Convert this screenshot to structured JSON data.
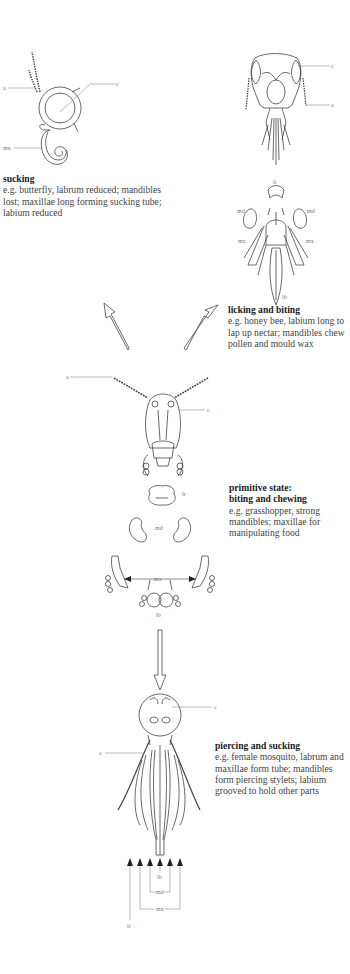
{
  "diagram": {
    "panels": [
      {
        "id": "butterfly",
        "title": "sucking",
        "body": "e.g. butterfly, labrum reduced; mandibles lost; maxillae long forming sucking tube; labium reduced",
        "labels": {
          "a": "a",
          "c": "c",
          "mx": "mx"
        }
      },
      {
        "id": "bee",
        "title": "licking and biting",
        "body": "e.g. honey bee, labium long to lap up nectar; mandibles chew pollen and mould wax",
        "labels": {
          "c": "c",
          "a": "a",
          "lr": "lr",
          "md_left": "md",
          "md_right": "md",
          "mx_left": "mx",
          "mx_right": "mx",
          "lb": "lb"
        }
      },
      {
        "id": "grasshopper",
        "title_line1": "primitive state:",
        "title_line2": "biting and chewing",
        "body": "e.g. grasshopper, strong mandibles; maxillae for manipulating food",
        "labels": {
          "a": "a",
          "c": "c",
          "lr": "lr",
          "md": "md",
          "mx": "mx",
          "lb": "lb"
        }
      },
      {
        "id": "mosquito",
        "title": "piercing and sucking",
        "body": "e.g. female mosquito, labrum and maxillae form tube; mandibles form piercing stylets; labium grooved to hold other parts",
        "labels": {
          "c": "c",
          "a": "a",
          "lb": "lb",
          "md": "md",
          "mx": "mx",
          "lr": "lr"
        }
      }
    ],
    "arrows": [
      {
        "from": "grasshopper",
        "to": "butterfly",
        "style": "hollow"
      },
      {
        "from": "grasshopper",
        "to": "bee",
        "style": "hollow"
      },
      {
        "from": "grasshopper",
        "to": "mosquito",
        "style": "hollow"
      }
    ],
    "colors": {
      "line": "#444444",
      "label": "#777777",
      "text": "#444444",
      "background": "#ffffff"
    }
  }
}
